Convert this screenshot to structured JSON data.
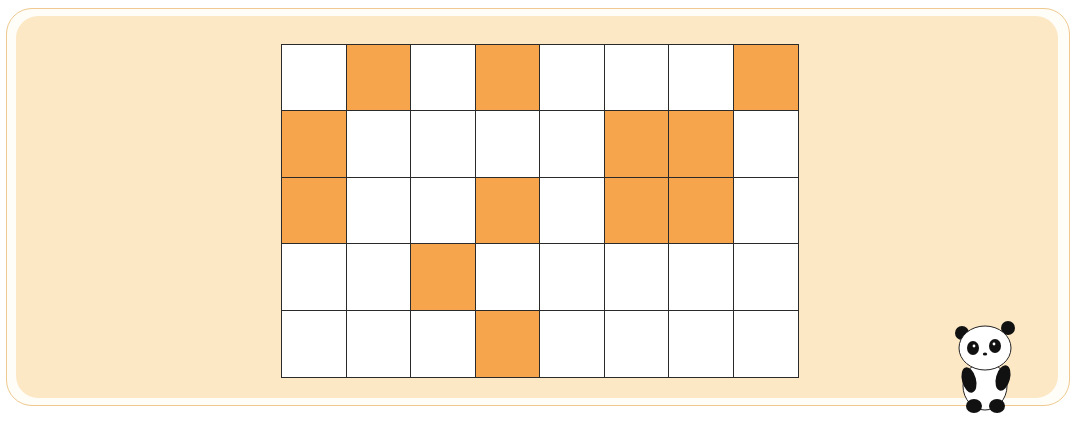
{
  "puzzle": {
    "rows": 5,
    "cols": 8,
    "shaded_cells": [
      [
        0,
        1
      ],
      [
        0,
        3
      ],
      [
        0,
        7
      ],
      [
        1,
        0
      ],
      [
        1,
        5
      ],
      [
        1,
        6
      ],
      [
        2,
        0
      ],
      [
        2,
        3
      ],
      [
        2,
        5
      ],
      [
        2,
        6
      ],
      [
        3,
        2
      ],
      [
        4,
        3
      ]
    ],
    "grid_matrix": [
      [
        0,
        1,
        0,
        1,
        0,
        0,
        0,
        1
      ],
      [
        1,
        0,
        0,
        0,
        0,
        1,
        1,
        0
      ],
      [
        1,
        0,
        0,
        1,
        0,
        1,
        1,
        0
      ],
      [
        0,
        0,
        1,
        0,
        0,
        0,
        0,
        0
      ],
      [
        0,
        0,
        0,
        1,
        0,
        0,
        0,
        0
      ]
    ],
    "shaded_count": 12
  },
  "colors": {
    "shaded": "#f7a54d",
    "unshaded": "#ffffff",
    "panel_background": "#fde8c6",
    "frame_border": "#efc98f",
    "grid_line": "#2a2a2a"
  },
  "mascot": {
    "icon": "panda-icon"
  }
}
